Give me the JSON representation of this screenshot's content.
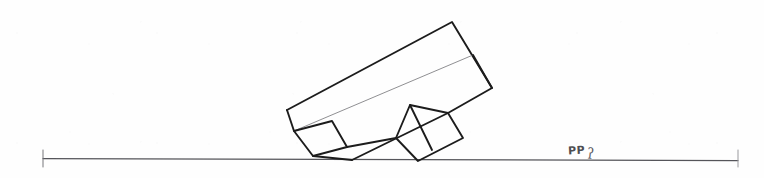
{
  "document": {
    "kind": "hand-drawn-architectural-sketch",
    "title": "Tilted building massing elevation over ground line",
    "width": 764,
    "height": 178,
    "background_color": "#fefefe",
    "ink_color": "#1c1c1c",
    "faint_ink_color": "#6d6d70",
    "ground_color": "#555558"
  },
  "annotations": {
    "label_text": "PP",
    "label_subscript": "ʔ",
    "label_x": 568,
    "label_y": 144
  },
  "chart_data": {
    "type": "line",
    "xlabel": "",
    "ylabel": "",
    "xlim": [
      0,
      764
    ],
    "ylim": [
      178,
      0
    ],
    "grid": false,
    "legend": "none",
    "ground_line": {
      "name": "ground-line",
      "x": [
        43,
        738
      ],
      "y": [
        158.5,
        160.5
      ],
      "left_tick": {
        "x": 43,
        "y0": 150,
        "y1": 167
      },
      "right_tick": {
        "x": 738,
        "y0": 150,
        "y1": 167
      }
    },
    "series": [
      {
        "name": "main-block-outline",
        "weight": "heavy",
        "closed": true,
        "x": [
          287,
          452,
          492,
          448,
          352
        ],
        "y": [
          110,
          22,
          88,
          113,
          160
        ]
      },
      {
        "name": "main-block-ridge-line",
        "weight": "faint",
        "closed": false,
        "x": [
          294,
          473
        ],
        "y": [
          131,
          55
        ]
      },
      {
        "name": "main-block-right-facet-edge",
        "weight": "heavy",
        "closed": false,
        "x": [
          473,
          492
        ],
        "y": [
          55,
          88
        ]
      },
      {
        "name": "lower-left-annex-square",
        "weight": "heavy",
        "closed": true,
        "x": [
          294,
          332,
          347,
          313
        ],
        "y": [
          131,
          121,
          147,
          156
        ]
      },
      {
        "name": "center-gable-wing",
        "weight": "heavy",
        "closed": true,
        "x": [
          410,
          448,
          463,
          418,
          396
        ],
        "y": [
          105,
          113,
          138,
          161,
          138
        ]
      },
      {
        "name": "center-gable-internal-line",
        "weight": "heavy",
        "closed": false,
        "x": [
          410,
          432
        ],
        "y": [
          105,
          150
        ]
      },
      {
        "name": "annex-base-link",
        "weight": "heavy",
        "closed": false,
        "x": [
          347,
          396
        ],
        "y": [
          147,
          138
        ]
      }
    ]
  }
}
